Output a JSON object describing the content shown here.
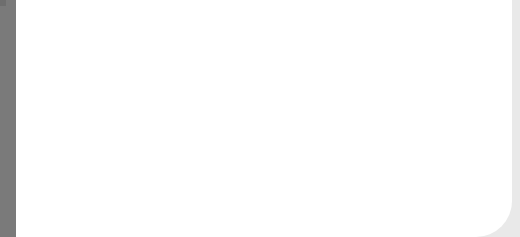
{
  "canvas": {
    "width": 520,
    "height": 237,
    "background": "#ffffff"
  },
  "colors": {
    "left_bar": "#7a7a7a",
    "right_edge": "#e9e9e9",
    "grid_line": "#9a9a9a",
    "highlight_border": "#6e6e6e"
  },
  "grid": {
    "vertical_lines_x": [
      42,
      68,
      94,
      120,
      146,
      172,
      198,
      224,
      250,
      276,
      302,
      328,
      354,
      380,
      406,
      432,
      458,
      486
    ],
    "horizontal_lines_y": [
      23,
      50,
      77,
      104,
      132,
      159,
      186,
      213
    ],
    "cell_size": 26
  },
  "highlight_box": {
    "x": 327,
    "y": 132,
    "width": 161,
    "height": 56
  }
}
